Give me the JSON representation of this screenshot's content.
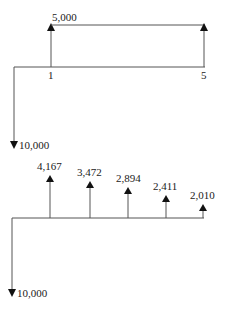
{
  "diagram_top": {
    "label_up": "5,000",
    "label_down": "10,000",
    "period_start": "1",
    "period_end": "5"
  },
  "diagram_bottom": {
    "label_down": "10,000",
    "flows": [
      {
        "label": "4,167"
      },
      {
        "label": "3,472"
      },
      {
        "label": "2,894"
      },
      {
        "label": "2,411"
      },
      {
        "label": "2,010"
      }
    ]
  }
}
